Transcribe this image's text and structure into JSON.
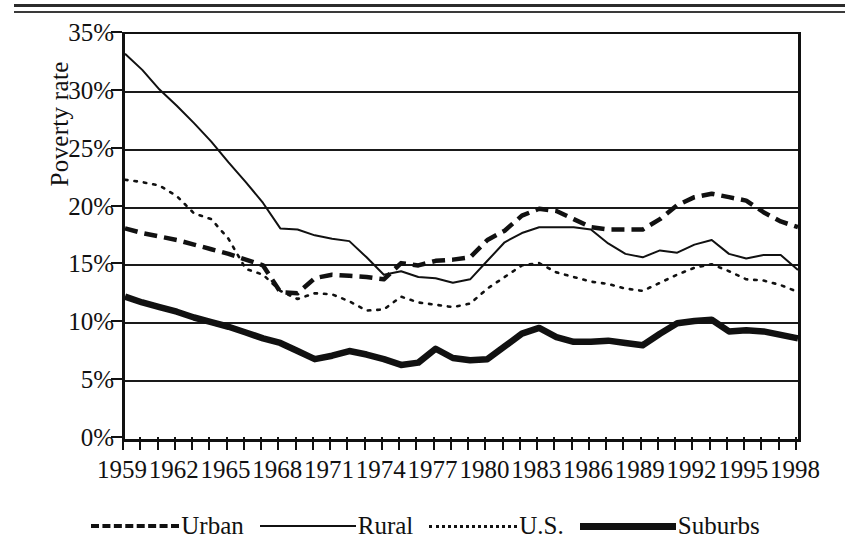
{
  "chart_data": {
    "type": "line",
    "title": "",
    "xlabel": "",
    "ylabel": "Poverty rate",
    "ylim": [
      0,
      35
    ],
    "yticks": [
      "0%",
      "5%",
      "10%",
      "15%",
      "20%",
      "25%",
      "30%",
      "35%"
    ],
    "ytick_values": [
      0,
      5,
      10,
      15,
      20,
      25,
      30,
      35
    ],
    "xlim": [
      1959,
      1998
    ],
    "xtick_labels": [
      "1959",
      "1962",
      "1965",
      "1968",
      "1971",
      "1974",
      "1977",
      "1980",
      "1983",
      "1986",
      "1989",
      "1992",
      "1995",
      "1998"
    ],
    "xtick_values": [
      1959,
      1962,
      1965,
      1968,
      1971,
      1974,
      1977,
      1980,
      1983,
      1986,
      1989,
      1992,
      1995,
      1998
    ],
    "grid": true,
    "legend_position": "bottom",
    "x": [
      1959,
      1960,
      1961,
      1962,
      1963,
      1964,
      1965,
      1966,
      1967,
      1968,
      1969,
      1970,
      1971,
      1972,
      1973,
      1974,
      1975,
      1976,
      1977,
      1978,
      1979,
      1980,
      1981,
      1982,
      1983,
      1984,
      1985,
      1986,
      1987,
      1988,
      1989,
      1990,
      1991,
      1992,
      1993,
      1994,
      1995,
      1996,
      1997,
      1998
    ],
    "series": [
      {
        "name": "Urban",
        "style": "dashed",
        "values": [
          18.2,
          17.8,
          17.5,
          17.2,
          16.8,
          16.4,
          16.0,
          15.5,
          15.0,
          12.7,
          12.6,
          13.9,
          14.2,
          14.1,
          14.0,
          13.8,
          15.2,
          15.0,
          15.4,
          15.5,
          15.7,
          17.2,
          18.0,
          19.3,
          19.9,
          19.7,
          19.0,
          18.3,
          18.1,
          18.1,
          18.1,
          19.0,
          20.2,
          20.9,
          21.2,
          20.9,
          20.6,
          19.6,
          18.8,
          18.3
        ]
      },
      {
        "name": "Rural",
        "style": "thin-solid",
        "values": [
          33.3,
          31.9,
          30.2,
          28.8,
          27.3,
          25.7,
          23.9,
          22.2,
          20.4,
          18.2,
          18.1,
          17.6,
          17.3,
          17.1,
          15.7,
          14.2,
          14.5,
          14.0,
          13.9,
          13.5,
          13.8,
          15.4,
          17.0,
          17.8,
          18.3,
          18.3,
          18.3,
          18.1,
          16.9,
          16.0,
          15.7,
          16.3,
          16.1,
          16.8,
          17.2,
          16.0,
          15.6,
          15.9,
          15.9,
          14.6
        ]
      },
      {
        "name": "U.S.",
        "style": "dotted",
        "values": [
          22.4,
          22.2,
          21.9,
          21.0,
          19.5,
          19.0,
          17.3,
          14.7,
          14.2,
          12.8,
          12.1,
          12.6,
          12.5,
          11.9,
          11.1,
          11.2,
          12.3,
          11.8,
          11.6,
          11.4,
          11.7,
          13.0,
          14.0,
          15.0,
          15.2,
          14.4,
          14.0,
          13.6,
          13.4,
          13.0,
          12.8,
          13.5,
          14.2,
          14.8,
          15.1,
          14.5,
          13.8,
          13.7,
          13.3,
          12.7
        ]
      },
      {
        "name": "Suburbs",
        "style": "thick-solid",
        "values": [
          12.3,
          11.8,
          11.4,
          11.0,
          10.5,
          10.1,
          9.7,
          9.2,
          8.7,
          8.3,
          7.6,
          6.9,
          7.2,
          7.6,
          7.3,
          6.9,
          6.4,
          6.6,
          7.8,
          7.0,
          6.8,
          6.9,
          8.0,
          9.1,
          9.6,
          8.8,
          8.4,
          8.4,
          8.5,
          8.3,
          8.1,
          9.1,
          10.0,
          10.2,
          10.3,
          9.3,
          9.4,
          9.3,
          9.0,
          8.7
        ]
      }
    ]
  },
  "legend": {
    "items": [
      {
        "label": "Urban",
        "style": "dashed"
      },
      {
        "label": "Rural",
        "style": "thin-solid"
      },
      {
        "label": "U.S.",
        "style": "dotted"
      },
      {
        "label": "Suburbs",
        "style": "thick-solid"
      }
    ]
  },
  "axis": {
    "y_title": "Poverty rate"
  },
  "colors": {
    "ink": "#111111",
    "background": "#ffffff"
  }
}
